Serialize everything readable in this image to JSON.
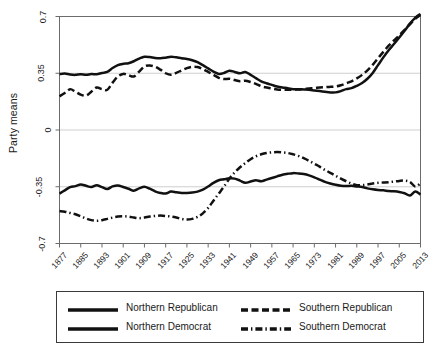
{
  "chart_data": {
    "type": "line",
    "title": "",
    "xlabel": "",
    "ylabel": "Party means",
    "xlim": [
      1877,
      2013
    ],
    "ylim": [
      -0.7,
      0.7
    ],
    "grid": true,
    "grid_axis": "y",
    "legend_position": "below",
    "yticks": [
      "0.7",
      "0.35",
      "0",
      "-0.35",
      "-0.7"
    ],
    "ytick_values": [
      0.7,
      0.35,
      0,
      -0.35,
      -0.7
    ],
    "xticks": [
      "1877",
      "1885",
      "1893",
      "1901",
      "1909",
      "1917",
      "1925",
      "1933",
      "1941",
      "1949",
      "1957",
      "1965",
      "1973",
      "1981",
      "1989",
      "1997",
      "2005",
      "2013"
    ],
    "xtick_values": [
      1877,
      1885,
      1893,
      1901,
      1909,
      1917,
      1925,
      1933,
      1941,
      1949,
      1957,
      1965,
      1973,
      1981,
      1989,
      1997,
      2005,
      2013
    ],
    "x": [
      1877,
      1879,
      1881,
      1883,
      1885,
      1887,
      1889,
      1891,
      1893,
      1895,
      1897,
      1899,
      1901,
      1903,
      1905,
      1907,
      1909,
      1911,
      1913,
      1915,
      1917,
      1919,
      1921,
      1923,
      1925,
      1927,
      1929,
      1931,
      1933,
      1935,
      1937,
      1939,
      1941,
      1943,
      1945,
      1947,
      1949,
      1951,
      1953,
      1955,
      1957,
      1959,
      1961,
      1963,
      1965,
      1967,
      1969,
      1971,
      1973,
      1975,
      1977,
      1979,
      1981,
      1983,
      1985,
      1987,
      1989,
      1991,
      1993,
      1995,
      1997,
      1999,
      2001,
      2003,
      2005,
      2007,
      2009,
      2011,
      2013
    ],
    "series": [
      {
        "name": "Northern Republican",
        "style": "solid",
        "color": "#111111",
        "values": [
          0.345,
          0.348,
          0.342,
          0.34,
          0.344,
          0.34,
          0.345,
          0.344,
          0.352,
          0.358,
          0.382,
          0.4,
          0.408,
          0.412,
          0.424,
          0.44,
          0.452,
          0.45,
          0.444,
          0.442,
          0.446,
          0.452,
          0.448,
          0.442,
          0.438,
          0.43,
          0.418,
          0.4,
          0.38,
          0.36,
          0.346,
          0.352,
          0.366,
          0.358,
          0.35,
          0.358,
          0.34,
          0.32,
          0.3,
          0.288,
          0.278,
          0.268,
          0.262,
          0.258,
          0.252,
          0.252,
          0.25,
          0.248,
          0.244,
          0.24,
          0.236,
          0.232,
          0.232,
          0.24,
          0.252,
          0.258,
          0.272,
          0.29,
          0.316,
          0.352,
          0.4,
          0.448,
          0.492,
          0.53,
          0.57,
          0.612,
          0.656,
          0.692,
          0.716
        ]
      },
      {
        "name": "Southern Republican",
        "style": "dashed",
        "color": "#111111",
        "values": [
          0.208,
          0.228,
          0.252,
          0.236,
          0.218,
          0.212,
          0.236,
          0.262,
          0.252,
          0.248,
          0.292,
          0.33,
          0.346,
          0.338,
          0.33,
          0.36,
          0.392,
          0.398,
          0.39,
          0.372,
          0.35,
          0.34,
          0.352,
          0.368,
          0.382,
          0.39,
          0.388,
          0.376,
          0.358,
          0.34,
          0.322,
          0.314,
          0.316,
          0.308,
          0.3,
          0.304,
          0.296,
          0.284,
          0.27,
          0.262,
          0.256,
          0.25,
          0.248,
          0.248,
          0.248,
          0.25,
          0.252,
          0.256,
          0.258,
          0.262,
          0.264,
          0.266,
          0.268,
          0.276,
          0.288,
          0.3,
          0.318,
          0.34,
          0.368,
          0.402,
          0.442,
          0.482,
          0.52,
          0.552,
          0.584,
          0.618,
          0.652,
          0.686,
          0.71
        ]
      },
      {
        "name": "Northern Democrat",
        "style": "solid",
        "color": "#111111",
        "values": [
          -0.392,
          -0.372,
          -0.352,
          -0.346,
          -0.336,
          -0.344,
          -0.352,
          -0.34,
          -0.352,
          -0.364,
          -0.348,
          -0.342,
          -0.352,
          -0.362,
          -0.374,
          -0.36,
          -0.35,
          -0.362,
          -0.378,
          -0.388,
          -0.392,
          -0.38,
          -0.384,
          -0.388,
          -0.388,
          -0.386,
          -0.38,
          -0.368,
          -0.348,
          -0.326,
          -0.31,
          -0.304,
          -0.298,
          -0.3,
          -0.312,
          -0.326,
          -0.318,
          -0.31,
          -0.316,
          -0.306,
          -0.296,
          -0.286,
          -0.276,
          -0.27,
          -0.266,
          -0.268,
          -0.272,
          -0.28,
          -0.292,
          -0.306,
          -0.32,
          -0.33,
          -0.338,
          -0.344,
          -0.346,
          -0.344,
          -0.348,
          -0.352,
          -0.36,
          -0.366,
          -0.37,
          -0.372,
          -0.376,
          -0.378,
          -0.382,
          -0.39,
          -0.404,
          -0.38,
          -0.398
        ]
      },
      {
        "name": "Southern Democrat",
        "style": "dashdot",
        "color": "#111111",
        "values": [
          -0.5,
          -0.504,
          -0.512,
          -0.52,
          -0.532,
          -0.546,
          -0.556,
          -0.56,
          -0.556,
          -0.548,
          -0.54,
          -0.534,
          -0.532,
          -0.534,
          -0.54,
          -0.544,
          -0.54,
          -0.534,
          -0.53,
          -0.528,
          -0.53,
          -0.534,
          -0.54,
          -0.548,
          -0.552,
          -0.548,
          -0.536,
          -0.514,
          -0.48,
          -0.436,
          -0.392,
          -0.348,
          -0.3,
          -0.262,
          -0.23,
          -0.204,
          -0.18,
          -0.162,
          -0.15,
          -0.142,
          -0.138,
          -0.136,
          -0.138,
          -0.142,
          -0.15,
          -0.16,
          -0.174,
          -0.19,
          -0.208,
          -0.226,
          -0.246,
          -0.264,
          -0.282,
          -0.3,
          -0.316,
          -0.33,
          -0.34,
          -0.34,
          -0.336,
          -0.33,
          -0.326,
          -0.324,
          -0.322,
          -0.318,
          -0.314,
          -0.312,
          -0.32,
          -0.348,
          -0.33
        ]
      }
    ]
  },
  "legend": {
    "entries": [
      {
        "label": "Northern Republican",
        "style": "solid"
      },
      {
        "label": "Southern Republican",
        "style": "dashed"
      },
      {
        "label": "Northern Democrat",
        "style": "solid"
      },
      {
        "label": "Southern Democrat",
        "style": "dashdot"
      }
    ]
  },
  "colors": {
    "line": "#111111",
    "frame": "#6b6b6b",
    "grid": "#c9c9c9",
    "background": "#ffffff"
  }
}
